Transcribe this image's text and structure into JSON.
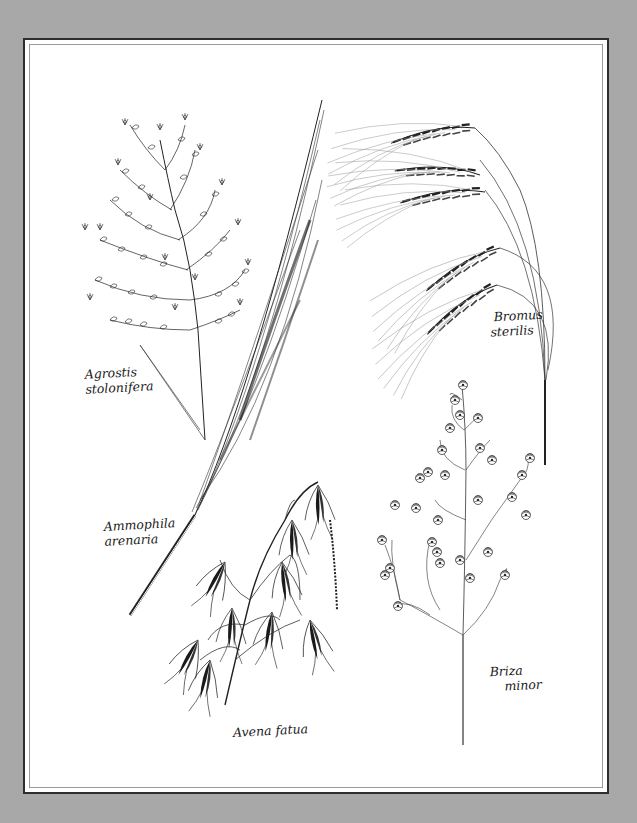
{
  "plate": {
    "background_color": "#a8a8a8",
    "paper_color": "#ffffff",
    "border_color": "#2e2e2e",
    "inner_line_color": "#9a9a9a"
  },
  "specimens": [
    {
      "id": "agrostis",
      "genus": "Agrostis",
      "species": "stolonifera"
    },
    {
      "id": "ammophila",
      "genus": "Ammophila",
      "species": "arenaria"
    },
    {
      "id": "bromus",
      "genus": "Bromus",
      "species": "sterilis"
    },
    {
      "id": "briza",
      "genus": "Briza",
      "species": "minor"
    },
    {
      "id": "avena",
      "genus": "Avena",
      "species": "fatua",
      "full": "Avena fatua"
    }
  ]
}
